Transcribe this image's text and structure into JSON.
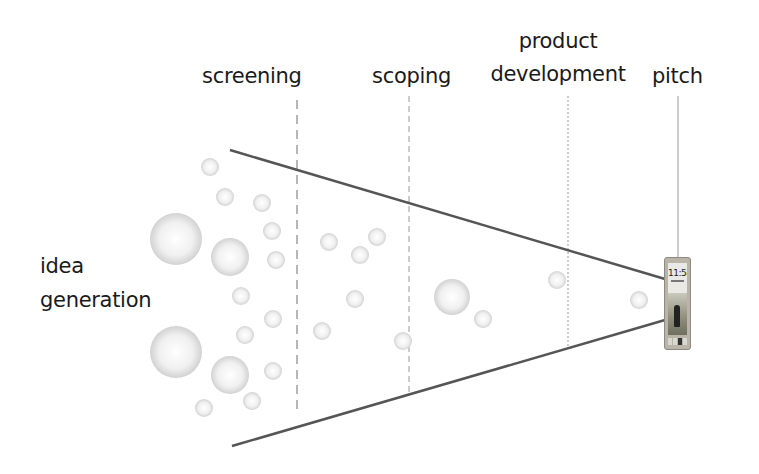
{
  "stages": [
    {
      "id": "idea-generation",
      "label_lines": [
        "idea",
        "generation"
      ]
    },
    {
      "id": "screening",
      "label_lines": [
        "screening"
      ]
    },
    {
      "id": "scoping",
      "label_lines": [
        "scoping"
      ]
    },
    {
      "id": "product-development",
      "label_lines": [
        "product",
        "development"
      ]
    },
    {
      "id": "pitch",
      "label_lines": [
        "pitch"
      ]
    }
  ],
  "labels": {
    "idea_1": "idea",
    "idea_2": "generation",
    "screening": "screening",
    "scoping": "scoping",
    "product_dev_1": "product",
    "product_dev_2": "development",
    "pitch": "pitch"
  },
  "phone": {
    "time": "11:54",
    "icon": "smartphone-icon"
  },
  "colors": {
    "funnel_line": "#555555",
    "divider": "#888888",
    "bubble_fill": "#e6e6e6",
    "bubble_edge": "#cfcfcf",
    "text": "#1a1a1a"
  }
}
